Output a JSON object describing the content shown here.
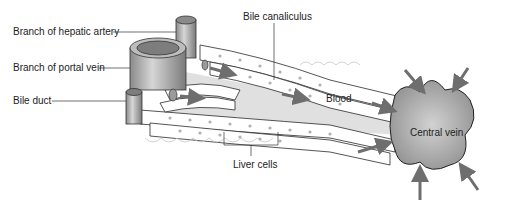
{
  "diagram": {
    "labels": {
      "hepatic_artery": "Branch of hepatic artery",
      "portal_vein": "Branch of portal vein",
      "bile_duct": "Bile duct",
      "bile_canaliculus": "Bile canaliculus",
      "blood": "Blood",
      "central_vein": "Central vein",
      "liver_cells": "Liver cells"
    },
    "colors": {
      "vessel": "#9a9a9a",
      "vein_fill": "#a8a8a8",
      "arrow": "#6e6e6e",
      "cell_outline": "#2a2a2a",
      "cell_nucleus": "#b0b0b0",
      "sinusoid": "#dcdcdc"
    }
  }
}
